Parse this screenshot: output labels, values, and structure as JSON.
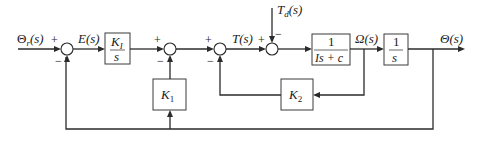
{
  "diagram": {
    "type": "block-diagram",
    "signals": {
      "reference": {
        "symbol": "Θ",
        "sub": "r",
        "arg": "(s)"
      },
      "error": {
        "label": "E(s)"
      },
      "torque": {
        "label": "T(s)"
      },
      "disturbance": {
        "symbol": "T",
        "sub": "d",
        "arg": "(s)"
      },
      "velocity": {
        "label": "Ω(s)"
      },
      "output": {
        "label": "Θ(s)"
      }
    },
    "blocks": {
      "integral_gain": {
        "num": "K",
        "num_sub": "I",
        "den": "s"
      },
      "plant": {
        "num": "1",
        "den": "Is + c"
      },
      "integrator": {
        "num": "1",
        "den": "s"
      },
      "k1": {
        "symbol": "K",
        "sub": "1"
      },
      "k2": {
        "symbol": "K",
        "sub": "2"
      }
    },
    "junctions": [
      {
        "id": "sum1",
        "signs": {
          "in_left": "+",
          "in_bottom": "−"
        }
      },
      {
        "id": "sum2",
        "signs": {
          "in_left": "+",
          "in_bottom": "−"
        }
      },
      {
        "id": "sum3",
        "signs": {
          "in_left": "+",
          "in_bottom": "−"
        }
      },
      {
        "id": "sum4",
        "signs": {
          "in_left": "+",
          "in_top": "−"
        }
      }
    ],
    "colors": {
      "line": "#2b2b2b",
      "background": "#ffffff"
    }
  }
}
